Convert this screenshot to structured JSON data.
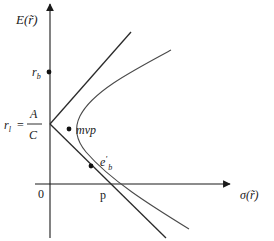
{
  "diagram": {
    "type": "mean-variance-frontier",
    "y_axis_label": "E(r̃)",
    "x_axis_label": "σ(r̃)",
    "origin_label": "0",
    "labels": {
      "r_b": "r",
      "r_b_sub": "b",
      "r_l_lhs": "r",
      "r_l_sub": "l",
      "equals": "=",
      "frac_num": "A",
      "frac_den": "C",
      "mvp": "mvp",
      "e_b": "e",
      "e_b_prime": "'",
      "e_b_sub": "b",
      "p": "p"
    },
    "points": [
      {
        "name": "r_b",
        "description": "point on vertical axis"
      },
      {
        "name": "mvp",
        "description": "minimum variance portfolio"
      },
      {
        "name": "e'_b",
        "description": "point on lower tangent line"
      },
      {
        "name": "p",
        "description": "intersection with horizontal axis"
      }
    ],
    "colors": {
      "axis": "#1a1a1a",
      "line": "#2a2a2a",
      "curve": "#4a4a4a"
    }
  }
}
